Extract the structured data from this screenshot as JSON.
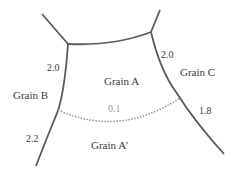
{
  "diagram": {
    "grains": [
      {
        "id": "A",
        "label": "Grain A"
      },
      {
        "id": "B",
        "label": "Grain B"
      },
      {
        "id": "C",
        "label": "Grain C"
      },
      {
        "id": "A_prime",
        "label": "Grain A’"
      }
    ],
    "boundary_values": {
      "left_upper": "2.0",
      "right_upper": "2.0",
      "right_lower": "1.8",
      "left_lower": "2.2",
      "dotted_boundary": "0.1"
    },
    "colors": {
      "solid_line": "#5a5a5a",
      "dotted_line": "#9a9a9a",
      "text": "#3a3a3a"
    }
  }
}
